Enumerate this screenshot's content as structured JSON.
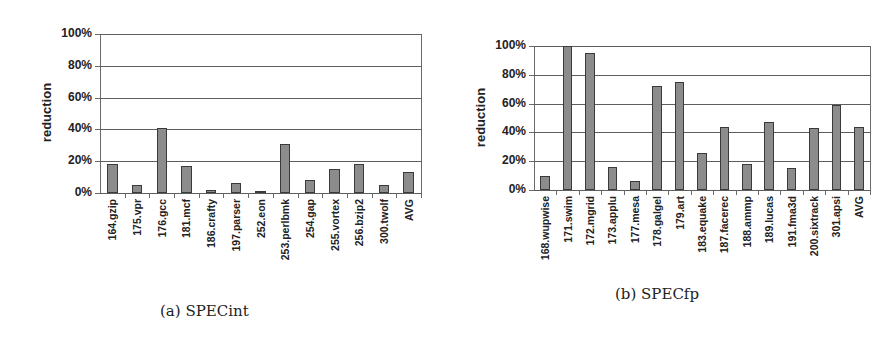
{
  "chart_data": [
    {
      "type": "bar",
      "title": "",
      "caption": "(a) SPECint",
      "xlabel": "",
      "ylabel": "reduction",
      "ylim": [
        0,
        100
      ],
      "yticks": [
        "0%",
        "20%",
        "40%",
        "60%",
        "80%",
        "100%"
      ],
      "grid": true,
      "legend": null,
      "categories": [
        "164.gzip",
        "175.vpr",
        "176.gcc",
        "181.mcf",
        "186.crafty",
        "197.parser",
        "252.eon",
        "253.perlbmk",
        "254.gap",
        "255.vortex",
        "256.bzip2",
        "300.twolf",
        "AVG"
      ],
      "values": [
        18,
        5,
        41,
        17,
        2,
        6,
        1,
        31,
        8,
        15,
        18,
        5,
        13
      ]
    },
    {
      "type": "bar",
      "title": "",
      "caption": "(b) SPECfp",
      "xlabel": "",
      "ylabel": "reduction",
      "ylim": [
        0,
        100
      ],
      "yticks": [
        "0%",
        "20%",
        "40%",
        "60%",
        "80%",
        "100%"
      ],
      "grid": true,
      "legend": null,
      "categories": [
        "168.wupwise",
        "171.swim",
        "172.mgrid",
        "173.applu",
        "177.mesa",
        "178.galgel",
        "179.art",
        "183.equake",
        "187.facerec",
        "188.ammp",
        "189.lucas",
        "191.fma3d",
        "200.sixtrack",
        "301.apsi",
        "AVG"
      ],
      "values": [
        10,
        100,
        95,
        16,
        6,
        72,
        75,
        26,
        44,
        18,
        47,
        15,
        43,
        59,
        44
      ]
    }
  ],
  "colors": {
    "bar_fill": "#8c8c8c",
    "bar_edge": "#3a3a3a",
    "grid": "#5e5e5e"
  }
}
